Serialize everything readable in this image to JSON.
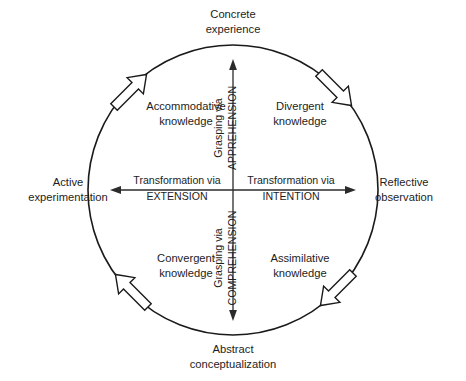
{
  "diagram": {
    "colors": {
      "stroke": "#1a1a1a",
      "text": "#1d1d1d",
      "background": "#ffffff",
      "arrow_fill": "#ffffff"
    },
    "poles": {
      "top": {
        "line1": "Concrete",
        "line2": "experience"
      },
      "right": {
        "line1": "Reflective",
        "line2": "observation"
      },
      "bottom": {
        "line1": "Abstract",
        "line2": "conceptualization"
      },
      "left": {
        "line1": "Active",
        "line2": "experimentation"
      }
    },
    "quadrants": [
      {
        "id": "top-left",
        "line1": "Accommodative",
        "line2": "knowledge"
      },
      {
        "id": "top-right",
        "line1": "Divergent",
        "line2": "knowledge"
      },
      {
        "id": "bottom-left",
        "line1": "Convergent",
        "line2": "knowledge"
      },
      {
        "id": "bottom-right",
        "line1": "Assimilative",
        "line2": "knowledge"
      }
    ],
    "axes": {
      "vertical_up": {
        "prefix": "Grasping via",
        "term": "APPREHENSION"
      },
      "vertical_down": {
        "prefix": "Grasping via",
        "term": "COMPREHENSION"
      },
      "horizontal_left": {
        "prefix": "Transformation via",
        "term": "EXTENSION"
      },
      "horizontal_right": {
        "prefix": "Transformation via",
        "term": "INTENTION"
      }
    },
    "cycle_arrows": [
      {
        "id": "arrow-top-left",
        "direction": "clockwise-up-right"
      },
      {
        "id": "arrow-top-right",
        "direction": "clockwise-down-right"
      },
      {
        "id": "arrow-bottom-right",
        "direction": "clockwise-down-left"
      },
      {
        "id": "arrow-bottom-left",
        "direction": "clockwise-up-left"
      }
    ]
  }
}
